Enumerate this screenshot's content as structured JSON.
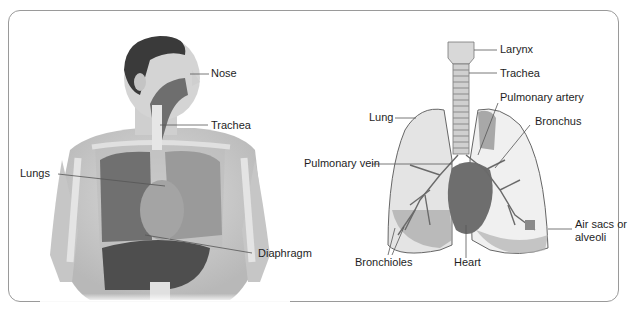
{
  "diagram": {
    "left_panel": {
      "subject": "human-torso-figure",
      "labels": [
        {
          "id": "nose",
          "text": "Nose"
        },
        {
          "id": "trachea",
          "text": "Trachea"
        },
        {
          "id": "lungs",
          "text": "Lungs"
        },
        {
          "id": "diaphragm",
          "text": "Diaphragm"
        }
      ]
    },
    "right_panel": {
      "subject": "lungs-detail-diagram",
      "labels": [
        {
          "id": "larynx",
          "text": "Larynx"
        },
        {
          "id": "trachea",
          "text": "Trachea"
        },
        {
          "id": "pulmonary_artery",
          "text": "Pulmonary artery"
        },
        {
          "id": "lung",
          "text": "Lung"
        },
        {
          "id": "bronchus",
          "text": "Bronchus"
        },
        {
          "id": "pulmonary_vein",
          "text": "Pulmonary vein"
        },
        {
          "id": "air_sacs",
          "text": "Air sacs or alveoli"
        },
        {
          "id": "bronchioles",
          "text": "Bronchioles"
        },
        {
          "id": "heart",
          "text": "Heart"
        }
      ]
    },
    "colors": {
      "frame_border": "#9a9a9a",
      "skin": "#c9c9c9",
      "organ_dark": "#6a6a6a",
      "organ_mid": "#8c8c8c",
      "lung_fill": "#e6e6e6",
      "leader_line": "#555555"
    }
  }
}
